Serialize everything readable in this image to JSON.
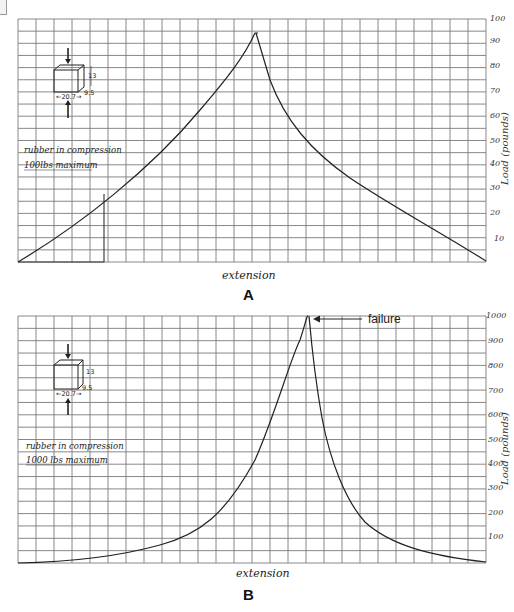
{
  "chart_data": [
    {
      "id": "A",
      "type": "line",
      "panel_label": "A",
      "title": "",
      "annotation": [
        "rubber in compression",
        "100lbs maximum"
      ],
      "specimen_dims": {
        "width": "20.7",
        "height": "13",
        "depth": "9.5"
      },
      "xlabel": "extension",
      "ylabel": "Load (pounds)",
      "ylim": [
        0,
        100
      ],
      "yticks": [
        10,
        20,
        30,
        40,
        50,
        60,
        70,
        80,
        90,
        100
      ],
      "grid": true,
      "x": [
        0,
        2,
        4,
        6,
        8,
        10,
        12,
        14,
        15,
        16,
        17,
        18,
        20,
        22,
        24,
        26
      ],
      "series": [
        {
          "name": "load",
          "values": [
            0,
            12,
            24,
            37,
            50,
            63,
            77,
            91,
            97,
            95,
            62,
            45,
            30,
            20,
            10,
            0
          ]
        }
      ],
      "notes": "Loading rises to ~94 lbs at peak then unloads along a decaying curve; a small rectangle marks the origin region (0–5 ext, 0–27 lbs)."
    },
    {
      "id": "B",
      "type": "line",
      "panel_label": "B",
      "title": "",
      "annotation": [
        "rubber in compression",
        "1000 lbs maximum"
      ],
      "specimen_dims": {
        "width": "20.7",
        "height": "13",
        "depth": "9.5"
      },
      "xlabel": "extension",
      "ylabel": "Load (pounds)",
      "ylim": [
        0,
        1000
      ],
      "yticks": [
        100,
        200,
        300,
        400,
        500,
        600,
        700,
        800,
        900,
        1000
      ],
      "grid": true,
      "x": [
        0,
        4,
        8,
        12,
        14,
        15,
        16,
        17,
        18,
        19,
        20,
        22,
        24,
        26
      ],
      "series": [
        {
          "name": "load",
          "values": [
            0,
            10,
            40,
            110,
            210,
            320,
            530,
            1000,
            400,
            200,
            130,
            60,
            25,
            0
          ]
        }
      ],
      "peak_annotation": "failure"
    }
  ],
  "charts": {
    "A": {
      "label": "A",
      "xlabel": "extension",
      "ylabel": "Load (pounds)",
      "note_line1": "rubber in compression",
      "note_line2": "100lbs maximum",
      "dim_w": "20.7",
      "dim_h": "13",
      "dim_d": "9.5",
      "ticks": [
        "100",
        "90",
        "80",
        "70",
        "60",
        "50",
        "40",
        "30",
        "20",
        "10"
      ]
    },
    "B": {
      "label": "B",
      "xlabel": "extension",
      "ylabel": "Load (pounds)",
      "note_line1": "rubber in compression",
      "note_line2": "1000 lbs maximum",
      "dim_w": "20.7",
      "dim_h": "13",
      "dim_d": "9.5",
      "failure_label": "failure",
      "ticks": [
        "1000",
        "900",
        "800",
        "700",
        "600",
        "500",
        "400",
        "300",
        "200",
        "100"
      ]
    }
  }
}
